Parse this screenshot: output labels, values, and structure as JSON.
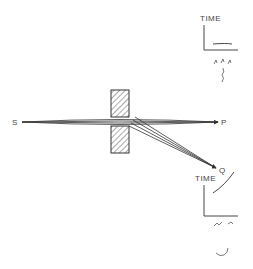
{
  "diagram": {
    "labels": {
      "source": "S",
      "target_p": "P",
      "target_q": "Q",
      "time_top": "TIME",
      "time_bottom": "TIME"
    },
    "colors": {
      "ink": "#333333",
      "hatch": "#555555",
      "background": "#ffffff"
    }
  }
}
